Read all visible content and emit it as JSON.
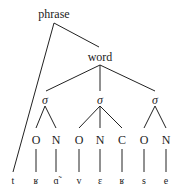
{
  "tree": {
    "root": "phrase",
    "word": "word",
    "syllable_symbol": "σ",
    "syllables": [
      {
        "constituents": [
          "O",
          "N"
        ],
        "segments": [
          "ʁ",
          "ɑ̃"
        ]
      },
      {
        "constituents": [
          "O",
          "N",
          "C"
        ],
        "segments": [
          "v",
          "ɛ",
          "ʁ"
        ]
      },
      {
        "constituents": [
          "O",
          "N"
        ],
        "segments": [
          "s",
          "e"
        ]
      }
    ],
    "extrasyllabic_segment": "t"
  },
  "labels": {
    "phrase": "phrase",
    "word": "word",
    "sigma1": "σ",
    "sigma2": "σ",
    "sigma3": "σ",
    "o1": "O",
    "n1": "N",
    "o2": "O",
    "n2": "N",
    "c2": "C",
    "o3": "O",
    "n3": "N",
    "seg_t": "t",
    "seg_r1": "ʁ",
    "seg_a": "ɑ̃",
    "seg_v": "v",
    "seg_e1": "ɛ",
    "seg_r2": "ʁ",
    "seg_s": "s",
    "seg_e2": "e"
  }
}
